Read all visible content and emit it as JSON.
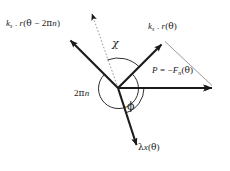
{
  "figure": {
    "type": "vector-diagram",
    "background_color": "#ffffff",
    "stroke_color": "#1a1a1a",
    "thin_stroke_color": "#7a7a7a",
    "width": 230,
    "height": 171,
    "origin": {
      "x": 118,
      "y": 88
    }
  },
  "labels": {
    "ks_r_theta_minus_2pin": {
      "text": "kₛ . r(θ − 2πn)",
      "symbol": "k",
      "subscript": "s",
      "separator": " . ",
      "function": "r",
      "argument": "θ − 2πn"
    },
    "ks_r_theta": {
      "text": "kₛ . r(θ)",
      "symbol": "k",
      "subscript": "s",
      "separator": " . ",
      "function": "r",
      "argument": "θ"
    },
    "p_equals_minus_fn_theta": {
      "text": "P = −Fₙ(θ)",
      "lhs": "P",
      "equals": " = ",
      "sign": "−",
      "symbol": "F",
      "subscript": "n",
      "argument": "(θ)"
    },
    "two_pi_n": {
      "text": "2πn",
      "coefficient": "2",
      "greek": "π",
      "index": "n"
    },
    "lambda_x_theta": {
      "text": "λx(θ)",
      "greek": "λ",
      "symbol": "x",
      "argument": "(θ)"
    },
    "chi_angle": {
      "text": "χ",
      "name": "chi"
    },
    "phi_angle": {
      "text": "ϕ",
      "name": "phi"
    }
  },
  "vectors": [
    {
      "name": "ks-r-theta-minus-2pin-vector",
      "label_key": "ks_r_theta_minus_2pin",
      "style": "solid-bold",
      "from": {
        "x": 118,
        "y": 88
      },
      "to": {
        "x": 68,
        "y": 38
      },
      "arrowhead": true
    },
    {
      "name": "reference-dotted-vector",
      "label_key": null,
      "style": "dotted-thin",
      "from": {
        "x": 118,
        "y": 88
      },
      "to": {
        "x": 91,
        "y": 11
      },
      "arrowhead": true
    },
    {
      "name": "ks-r-theta-vector",
      "label_key": "ks_r_theta",
      "style": "solid-bold",
      "from": {
        "x": 118,
        "y": 88
      },
      "to": {
        "x": 164,
        "y": 42
      },
      "arrowhead": true
    },
    {
      "name": "p-force-vector",
      "label_key": "p_equals_minus_fn_theta",
      "style": "solid-bold",
      "from": {
        "x": 118,
        "y": 88
      },
      "to": {
        "x": 215,
        "y": 88
      },
      "arrowhead": true
    },
    {
      "name": "lambda-x-theta-vector",
      "label_key": "lambda_x_theta",
      "style": "solid-bold",
      "from": {
        "x": 118,
        "y": 88
      },
      "to": {
        "x": 139,
        "y": 152
      },
      "arrowhead": true
    },
    {
      "name": "triangle-closing-segment",
      "label_key": null,
      "style": "solid-thin",
      "from": {
        "x": 164,
        "y": 42
      },
      "to": {
        "x": 215,
        "y": 88
      },
      "arrowhead": false
    }
  ],
  "arcs": [
    {
      "name": "chi-arc",
      "label_key": "chi_angle",
      "radius": 30,
      "from_vector": "reference-dotted-vector",
      "to_vector": "ks-r-theta-vector"
    },
    {
      "name": "two-pi-n-arc",
      "label_key": "two_pi_n",
      "radius": 20,
      "note": "large reflex arc about the origin"
    },
    {
      "name": "phi-arc",
      "label_key": "phi_angle",
      "radius": 26,
      "from_vector": "lambda-x-theta-vector",
      "to_vector": "p-force-vector"
    }
  ]
}
